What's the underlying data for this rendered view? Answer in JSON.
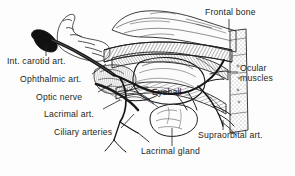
{
  "figure": {
    "background_color": "#fdfdfd",
    "ink_color": "#231f20",
    "style": "engraved pen-and-ink anatomical illustration"
  },
  "labels": {
    "int_carotid": "Int. carotid art.",
    "ophthalmic": "Ophthalmic art.",
    "optic_nerve": "Optic nerve",
    "lacrimal_art": "Lacrimal art.",
    "ciliary": "Ciliary arteries",
    "lacrimal_gland": "Lacrimal gland",
    "frontal_bone": "Frontal bone",
    "ocular_line1": "Ocular",
    "ocular_line2": "muscles",
    "supraorbital": "Supraorbital art.",
    "eyeball": "Eyeball"
  }
}
